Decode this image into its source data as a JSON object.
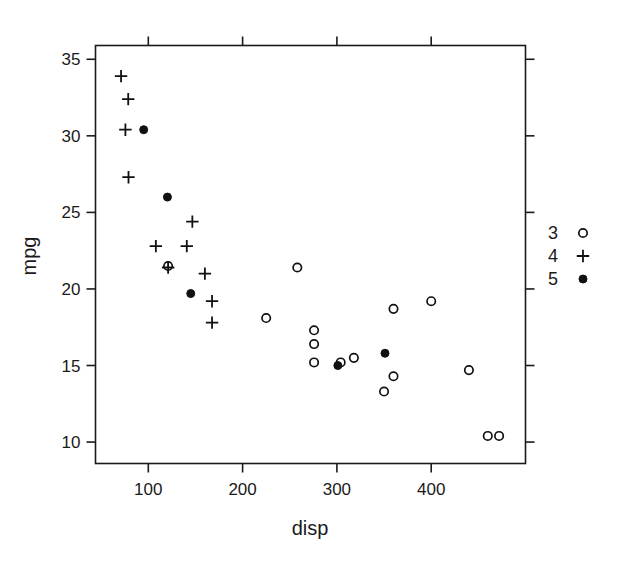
{
  "chart_data": {
    "type": "scatter",
    "title": "",
    "xlabel": "disp",
    "ylabel": "mpg",
    "xlim": [
      44,
      500
    ],
    "ylim": [
      8.6,
      35.9
    ],
    "xticks": [
      100,
      200,
      300,
      400
    ],
    "yticks": [
      35,
      30,
      25,
      20,
      15,
      10
    ],
    "grid": false,
    "legend": {
      "position": "right",
      "title": "",
      "entries": [
        {
          "label": "3",
          "marker": "open-circle"
        },
        {
          "label": "4",
          "marker": "plus"
        },
        {
          "label": "5",
          "marker": "filled-circle"
        }
      ]
    },
    "series": [
      {
        "name": "3",
        "marker": "open-circle",
        "points": [
          {
            "x": 258.0,
            "y": 21.4
          },
          {
            "x": 225.0,
            "y": 18.1
          },
          {
            "x": 360.0,
            "y": 18.7
          },
          {
            "x": 360.0,
            "y": 14.3
          },
          {
            "x": 275.8,
            "y": 17.3
          },
          {
            "x": 275.8,
            "y": 16.4
          },
          {
            "x": 275.8,
            "y": 15.2
          },
          {
            "x": 472.0,
            "y": 10.4
          },
          {
            "x": 460.0,
            "y": 10.4
          },
          {
            "x": 440.0,
            "y": 14.7
          },
          {
            "x": 318.0,
            "y": 15.5
          },
          {
            "x": 304.0,
            "y": 15.2
          },
          {
            "x": 350.0,
            "y": 13.3
          },
          {
            "x": 400.0,
            "y": 19.2
          },
          {
            "x": 121.0,
            "y": 21.5
          }
        ]
      },
      {
        "name": "4",
        "marker": "plus",
        "points": [
          {
            "x": 71.1,
            "y": 33.9
          },
          {
            "x": 78.7,
            "y": 32.4
          },
          {
            "x": 75.7,
            "y": 30.4
          },
          {
            "x": 79.0,
            "y": 27.3
          },
          {
            "x": 146.7,
            "y": 24.4
          },
          {
            "x": 108.0,
            "y": 22.8
          },
          {
            "x": 140.8,
            "y": 22.8
          },
          {
            "x": 121.0,
            "y": 21.4
          },
          {
            "x": 160.0,
            "y": 21.0
          },
          {
            "x": 167.6,
            "y": 19.2
          },
          {
            "x": 167.6,
            "y": 17.8
          }
        ]
      },
      {
        "name": "5",
        "marker": "filled-circle",
        "points": [
          {
            "x": 95.1,
            "y": 30.4
          },
          {
            "x": 120.3,
            "y": 26.0
          },
          {
            "x": 145.0,
            "y": 19.7
          },
          {
            "x": 301.0,
            "y": 15.0
          },
          {
            "x": 351.0,
            "y": 15.8
          }
        ]
      }
    ]
  },
  "axes": {
    "x_label": "disp",
    "y_label": "mpg",
    "x_tick_labels": [
      "100",
      "200",
      "300",
      "400"
    ],
    "y_tick_labels": [
      "35",
      "30",
      "25",
      "20",
      "15",
      "10"
    ]
  },
  "legend": {
    "items": [
      {
        "label": "3",
        "marker": "open-circle"
      },
      {
        "label": "4",
        "marker": "plus"
      },
      {
        "label": "5",
        "marker": "filled-circle"
      }
    ]
  },
  "colors": {
    "foreground": "#111111",
    "background": "#ffffff"
  }
}
